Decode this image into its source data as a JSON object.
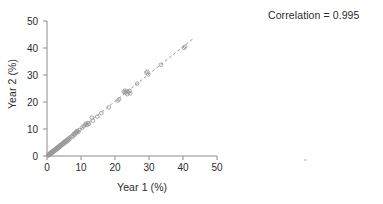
{
  "chart_data": {
    "type": "scatter",
    "title": "",
    "subtitle": "",
    "xlabel": "Year 1 (%)",
    "ylabel": "Year 2 (%)",
    "xlim": [
      0,
      50
    ],
    "ylim": [
      0,
      50
    ],
    "xticks": [
      0,
      10,
      20,
      30,
      40,
      50
    ],
    "yticks": [
      0,
      10,
      20,
      30,
      40,
      50
    ],
    "grid": false,
    "legend": null,
    "annotations": [
      {
        "name": "correlation",
        "text": "Correlation = 0.995",
        "position": "top-right"
      }
    ],
    "marker": {
      "shape": "open-circle",
      "size": 3.6,
      "edge_color": "#9a9a9a",
      "fill": "none"
    },
    "reference_line": {
      "name": "identity-line",
      "style": "dashed",
      "color": "#8c8c8c",
      "x": [
        0,
        43
      ],
      "y": [
        0,
        43.5
      ],
      "slope": 1.012,
      "intercept": 0
    },
    "series": [
      {
        "name": "Year 1 vs Year 2",
        "points": [
          [
            0.3,
            0.2
          ],
          [
            0.4,
            0.5
          ],
          [
            0.5,
            0.3
          ],
          [
            0.6,
            0.7
          ],
          [
            0.7,
            0.4
          ],
          [
            0.8,
            0.9
          ],
          [
            0.9,
            0.6
          ],
          [
            1.0,
            1.1
          ],
          [
            1.1,
            0.8
          ],
          [
            1.2,
            1.3
          ],
          [
            1.3,
            1.0
          ],
          [
            1.4,
            1.5
          ],
          [
            1.5,
            1.2
          ],
          [
            1.6,
            1.7
          ],
          [
            1.7,
            1.4
          ],
          [
            1.8,
            1.9
          ],
          [
            1.9,
            1.6
          ],
          [
            2.0,
            2.1
          ],
          [
            2.1,
            1.8
          ],
          [
            2.2,
            2.3
          ],
          [
            2.4,
            2.0
          ],
          [
            2.5,
            2.6
          ],
          [
            2.6,
            2.3
          ],
          [
            2.8,
            2.9
          ],
          [
            2.9,
            2.5
          ],
          [
            3.0,
            3.1
          ],
          [
            3.2,
            2.8
          ],
          [
            3.3,
            3.4
          ],
          [
            3.5,
            3.1
          ],
          [
            3.6,
            3.7
          ],
          [
            3.8,
            3.4
          ],
          [
            3.9,
            4.0
          ],
          [
            4.0,
            3.7
          ],
          [
            4.2,
            4.3
          ],
          [
            4.3,
            4.0
          ],
          [
            4.5,
            4.6
          ],
          [
            4.6,
            4.3
          ],
          [
            4.8,
            4.9
          ],
          [
            4.9,
            4.5
          ],
          [
            5.0,
            5.2
          ],
          [
            5.2,
            4.8
          ],
          [
            5.4,
            5.5
          ],
          [
            5.5,
            5.1
          ],
          [
            5.7,
            5.8
          ],
          [
            5.9,
            5.4
          ],
          [
            6.0,
            6.1
          ],
          [
            6.2,
            5.8
          ],
          [
            6.4,
            6.5
          ],
          [
            6.6,
            6.2
          ],
          [
            6.8,
            6.9
          ],
          [
            7.2,
            7.3
          ],
          [
            7.5,
            7.1
          ],
          [
            7.8,
            8.0
          ],
          [
            8.0,
            8.3
          ],
          [
            8.2,
            7.9
          ],
          [
            8.4,
            8.6
          ],
          [
            8.6,
            9.1
          ],
          [
            8.8,
            8.8
          ],
          [
            9.0,
            9.3
          ],
          [
            9.2,
            8.9
          ],
          [
            9.5,
            9.6
          ],
          [
            10.3,
            10.5
          ],
          [
            10.8,
            11.0
          ],
          [
            11.2,
            11.6
          ],
          [
            11.5,
            12.0
          ],
          [
            11.8,
            11.5
          ],
          [
            12.0,
            12.2
          ],
          [
            12.3,
            11.9
          ],
          [
            13.2,
            14.2
          ],
          [
            13.5,
            13.1
          ],
          [
            14.8,
            14.6
          ],
          [
            16.0,
            15.9
          ],
          [
            18.2,
            18.0
          ],
          [
            20.8,
            20.5
          ],
          [
            21.2,
            21.0
          ],
          [
            22.6,
            23.8
          ],
          [
            22.9,
            24.2
          ],
          [
            23.1,
            23.5
          ],
          [
            23.4,
            24.0
          ],
          [
            23.6,
            22.9
          ],
          [
            24.0,
            23.6
          ],
          [
            24.3,
            24.1
          ],
          [
            24.5,
            23.2
          ],
          [
            26.5,
            26.8
          ],
          [
            29.2,
            30.9
          ],
          [
            29.5,
            31.2
          ],
          [
            29.8,
            30.2
          ],
          [
            33.5,
            33.8
          ],
          [
            40.3,
            40.0
          ],
          [
            40.6,
            40.5
          ]
        ]
      }
    ]
  },
  "axes": {
    "x_tick_labels": [
      "0",
      "10",
      "20",
      "30",
      "40",
      "50"
    ],
    "y_tick_labels": [
      "0",
      "10",
      "20",
      "30",
      "40",
      "50"
    ]
  }
}
